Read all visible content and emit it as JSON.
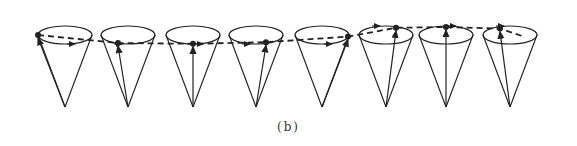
{
  "figure": {
    "caption": "(b)",
    "stroke_color": "#222222",
    "cones": [
      {
        "cx": 65,
        "tip_dx": -27,
        "tip_dy": 0
      },
      {
        "cx": 128,
        "tip_dx": -10,
        "tip_dy": 10
      },
      {
        "cx": 193,
        "tip_dx": 0,
        "tip_dy": 11
      },
      {
        "cx": 256,
        "tip_dx": 10,
        "tip_dy": 9
      },
      {
        "cx": 322,
        "tip_dx": 26,
        "tip_dy": 2
      },
      {
        "cx": 386,
        "tip_dx": 10,
        "tip_dy": -9
      },
      {
        "cx": 446,
        "tip_dx": 0,
        "tip_dy": -10
      },
      {
        "cx": 510,
        "tip_dx": -10,
        "tip_dy": -8
      }
    ]
  }
}
